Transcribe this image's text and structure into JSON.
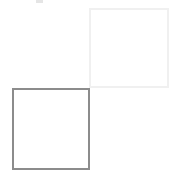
{
  "canvas": {
    "width_px": 177,
    "height_px": 176,
    "background_color": "#ffffff",
    "description": "Two outlined squares arranged diagonally on a white background"
  },
  "shapes": [
    {
      "name": "light-gray-square",
      "label": "Light gray outlined square",
      "position": "top-right",
      "x": 89,
      "y": 8,
      "width": 80,
      "height": 80,
      "border_width_px": 2,
      "border_color": "#f0f0f0",
      "fill": "none"
    },
    {
      "name": "medium-gray-square",
      "label": "Medium gray outlined square",
      "position": "bottom-left",
      "x": 12,
      "y": 88,
      "width": 78,
      "height": 82,
      "border_width_px": 2,
      "border_color": "#8c8c8c",
      "fill": "none"
    }
  ],
  "artifact": {
    "name": "faint-mark",
    "label": "Faint light gray speck near top edge",
    "x": 36,
    "y": 0,
    "width": 7,
    "height": 3,
    "color": "#e2e2e2"
  },
  "chart_data": {
    "type": "diagram",
    "title": "",
    "shape_count": 2,
    "shape_labels": [
      "light gray square",
      "medium gray square"
    ],
    "layout_hint": "corner-to-corner diagonal contact: gray square top-right corner touches light square bottom-left corner"
  }
}
